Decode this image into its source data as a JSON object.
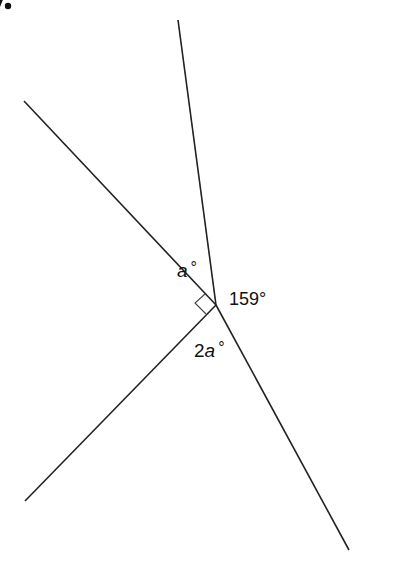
{
  "question": {
    "number_fragment": "7."
  },
  "diagram": {
    "vertex": [
      216,
      305
    ],
    "rays": [
      {
        "name": "top",
        "end": [
          178,
          20
        ]
      },
      {
        "name": "upper-left",
        "end": [
          24,
          101
        ]
      },
      {
        "name": "lower-left",
        "end": [
          25,
          501
        ]
      },
      {
        "name": "lower-right",
        "end": [
          349,
          550
        ]
      }
    ],
    "right_angle_marker": {
      "between": [
        "upper-left",
        "lower-left"
      ]
    },
    "labels": {
      "angle_a": {
        "var": "a",
        "deg": "°"
      },
      "angle_159": "159°",
      "angle_2a": {
        "coef": "2",
        "var": "a",
        "deg": "°"
      }
    },
    "line_color": "#222222"
  }
}
